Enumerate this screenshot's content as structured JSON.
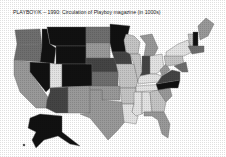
{
  "title": "PLAYBOY/K – 1990: Circulation of Playboy magazine (in 1000s)",
  "shades": {
    "black": "#111111",
    "dark": "#444444",
    "mid_dark": "#6e6e6e",
    "mid": "#999999",
    "light": "#c4c4c4",
    "very_light": "#e2e2e2"
  },
  "map": {
    "subject": "United States by state",
    "legend_visible": false
  }
}
